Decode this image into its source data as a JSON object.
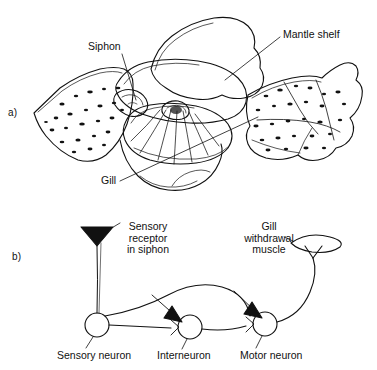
{
  "figure": {
    "background_color": "#ffffff",
    "ink_color": "#111111",
    "width": 377,
    "height": 370
  },
  "panel_a": {
    "letter": "a)",
    "caption_type": "anatomical-drawing",
    "subject": "Aplysia dorsal view with mantle, siphon and gill exposed",
    "labels": [
      {
        "name": "siphon",
        "text": "Siphon"
      },
      {
        "name": "mantle-shelf",
        "text": "Mantle shelf"
      },
      {
        "name": "gill",
        "text": "Gill"
      }
    ]
  },
  "panel_b": {
    "letter": "b)",
    "caption_type": "neural-circuit-schematic",
    "labels": [
      {
        "name": "sensory-receptor",
        "text": "Sensory\nreceptor\nin siphon"
      },
      {
        "name": "gill-withdrawal-muscle",
        "text": "Gill\nwithdrawal\nmuscle"
      },
      {
        "name": "sensory-neuron",
        "text": "Sensory neuron"
      },
      {
        "name": "interneuron",
        "text": "Interneuron"
      },
      {
        "name": "motor-neuron",
        "text": "Motor neuron"
      }
    ],
    "nodes": [
      {
        "name": "sensory-neuron",
        "cx": 97,
        "cy": 325,
        "r": 12
      },
      {
        "name": "interneuron",
        "cx": 190,
        "cy": 327,
        "r": 12
      },
      {
        "name": "motor-neuron",
        "cx": 265,
        "cy": 324,
        "r": 12
      }
    ]
  }
}
